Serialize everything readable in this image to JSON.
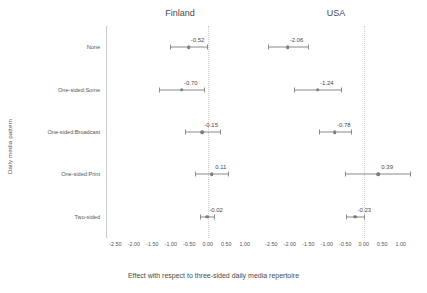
{
  "chart_data": {
    "type": "scatter",
    "plot_style": "coefficient-forest-plot",
    "title": "",
    "xlabel": "Effect with respect to three-sided daily media repertoire",
    "ylabel": "Daily media pattern",
    "xlim": [
      -2.75,
      1.25
    ],
    "xticks": [
      -2.5,
      -2.0,
      -1.5,
      -1.0,
      -0.5,
      0.0,
      0.5,
      1.0
    ],
    "xticklabels": [
      "-2.50",
      "-2.00",
      "-1.50",
      "-1.00",
      "-0.50",
      "0.00",
      "0.50",
      "1.00"
    ],
    "categories": [
      "None",
      "One-sided:Some",
      "One-sided:Broadcast",
      "One-sided:Print",
      "Two-sided"
    ],
    "grid": false,
    "reference_line": 0,
    "legend": "none",
    "facets": [
      {
        "name": "Finland",
        "points": [
          {
            "category": "None",
            "estimate": -0.52,
            "label": "-0.52",
            "ci_low": -1.02,
            "ci_high": -0.02
          },
          {
            "category": "One-sided:Some",
            "estimate": -0.7,
            "label": "-0.70",
            "ci_low": -1.33,
            "ci_high": -0.09
          },
          {
            "category": "One-sided:Broadcast",
            "estimate": -0.15,
            "label": "-0.15",
            "ci_low": -0.62,
            "ci_high": 0.32
          },
          {
            "category": "One-sided:Print",
            "estimate": 0.11,
            "label": "0.11",
            "ci_low": -0.34,
            "ci_high": 0.56
          },
          {
            "category": "Two-sided",
            "estimate": -0.02,
            "label": "-0.02",
            "ci_low": -0.2,
            "ci_high": 0.16
          }
        ]
      },
      {
        "name": "USA",
        "points": [
          {
            "category": "None",
            "estimate": -2.06,
            "label": "-2.06",
            "ci_low": -2.6,
            "ci_high": -1.52
          },
          {
            "category": "One-sided:Some",
            "estimate": -1.24,
            "label": "-1.24",
            "ci_low": -1.88,
            "ci_high": -0.61
          },
          {
            "category": "One-sided:Broadcast",
            "estimate": -0.78,
            "label": "-0.78",
            "ci_low": -1.21,
            "ci_high": -0.35
          },
          {
            "category": "One-sided:Print",
            "estimate": 0.39,
            "label": "0.39",
            "ci_low": -0.5,
            "ci_high": 1.24
          },
          {
            "category": "Two-sided",
            "estimate": -0.23,
            "label": "-0.23",
            "ci_low": -0.48,
            "ci_high": 0.02
          }
        ]
      }
    ]
  },
  "style": {
    "point_color": "#7d7d7d",
    "line_color": "#8a8a8a",
    "axis_color": "#c9c9c9",
    "text_color": "#4a4a4a",
    "background": "#ffffff"
  }
}
